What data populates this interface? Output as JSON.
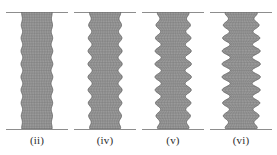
{
  "figure": {
    "kind": "finite-element-mesh-buckling-modes",
    "background_color": "#ffffff",
    "mesh_color": "#6f6f6f",
    "mesh_fill_color": "#9a9a9a",
    "rule_color": "#8d8d8d",
    "label_color": "#2b2b2b",
    "panel_count": 4
  },
  "chart_data": {
    "type": "line",
    "title": "",
    "subtitle": "",
    "xlabel": "",
    "ylabel": "",
    "grid": false,
    "legend_position": "none",
    "categories": [
      "(ii)",
      "(iv)",
      "(v)",
      "(vi)"
    ],
    "series": [
      {
        "name": "wave_lobes",
        "values": [
          9,
          9,
          9,
          9
        ]
      },
      {
        "name": "edge_amplitude_px",
        "values": [
          0.9,
          2.1,
          3.2,
          4.2
        ]
      },
      {
        "name": "column_width_px",
        "values": [
          30,
          30,
          30,
          30
        ]
      },
      {
        "name": "column_height_px",
        "values": [
          117,
          117,
          117,
          117
        ]
      }
    ],
    "xlim": [
      0,
      277
    ],
    "ylim": [
      0,
      155
    ]
  },
  "panels": [
    {
      "label": "(ii)",
      "name": "panel-ii",
      "left": 6,
      "width": 62,
      "rule_width": 62,
      "column_left": 22,
      "column_width": 30,
      "amplitude": 0.9,
      "lobes": 9,
      "phase": 0.0,
      "mesh_cols": 12,
      "mesh_rows": 44
    },
    {
      "label": "(iv)",
      "name": "panel-iv",
      "left": 74,
      "width": 62,
      "rule_width": 62,
      "column_left": 90,
      "column_width": 30,
      "amplitude": 2.1,
      "lobes": 9,
      "phase": 0.0,
      "mesh_cols": 12,
      "mesh_rows": 44
    },
    {
      "label": "(v)",
      "name": "panel-v",
      "left": 142,
      "width": 62,
      "rule_width": 62,
      "column_left": 158,
      "column_width": 30,
      "amplitude": 3.2,
      "lobes": 9,
      "phase": 0.0,
      "mesh_cols": 12,
      "mesh_rows": 44
    },
    {
      "label": "(vi)",
      "name": "panel-vi",
      "left": 210,
      "width": 62,
      "rule_width": 62,
      "column_left": 226,
      "column_width": 30,
      "amplitude": 4.2,
      "lobes": 9,
      "phase": 0.0,
      "mesh_cols": 12,
      "mesh_rows": 44
    }
  ]
}
